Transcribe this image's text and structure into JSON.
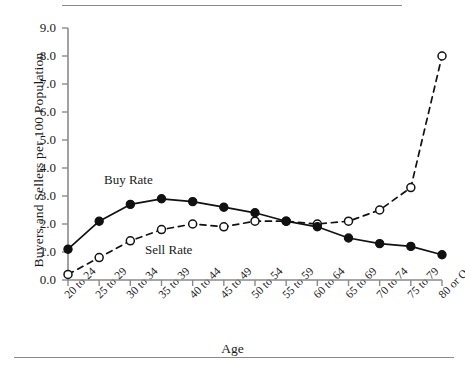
{
  "chart_data": {
    "type": "line",
    "title": "",
    "xlabel": "Age",
    "ylabel": "Buyers and Sellers per 100 Population",
    "categories": [
      "20 to 24",
      "25 to 29",
      "30 to 34",
      "35 to 39",
      "40 to 44",
      "45 to 49",
      "50 to 54",
      "55 to 59",
      "60 to 64",
      "65 to 69",
      "70 to 74",
      "75 to 79",
      "80 or Over"
    ],
    "ylim": [
      0.0,
      9.0
    ],
    "yticks": [
      "0.0",
      "1.0",
      "2.0",
      "3.0",
      "4.0",
      "5.0",
      "6.0",
      "7.0",
      "8.0",
      "9.0"
    ],
    "grid": false,
    "legend_position": "inline-annotations",
    "series": [
      {
        "name": "Buy Rate",
        "marker": "filled-circle",
        "line_style": "solid",
        "color": "#111111",
        "values": [
          1.1,
          2.1,
          2.7,
          2.9,
          2.8,
          2.6,
          2.4,
          2.1,
          1.9,
          1.5,
          1.3,
          1.2,
          0.9
        ]
      },
      {
        "name": "Sell Rate",
        "marker": "open-circle",
        "line_style": "dashed",
        "color": "#111111",
        "values": [
          0.2,
          0.8,
          1.4,
          1.8,
          2.0,
          1.9,
          2.1,
          2.1,
          2.0,
          2.1,
          2.5,
          3.3,
          8.0
        ]
      }
    ],
    "annotations": [
      {
        "text": "Buy Rate",
        "near_category": "30 to 34"
      },
      {
        "text": "Sell Rate",
        "near_category": "40 to 44"
      }
    ]
  },
  "axes": {
    "y_title": "Buyers and Sellers per 100 Population",
    "x_title": "Age"
  },
  "colors": {
    "axis": "#8a8a8a",
    "ink": "#111111",
    "rule": "#8a8a8a",
    "background": "#ffffff"
  }
}
